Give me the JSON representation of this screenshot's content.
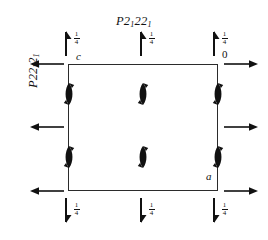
{
  "diagram": {
    "type": "space-group-symmetry-diagram",
    "title": {
      "letter": "P",
      "symbol_parts": [
        "2",
        "1",
        "2",
        "2",
        "1"
      ],
      "text": "P2122₁"
    },
    "side_title": {
      "text": "P22₁2₁"
    },
    "axis_labels": {
      "c": "c",
      "a": "a",
      "origin": "0"
    },
    "fraction_label": {
      "numerator": "1",
      "denominator": "4"
    },
    "top_markers": [
      {
        "name": "top-left-half-arrow",
        "fraction_num": "1",
        "fraction_den": "4",
        "direction": "up"
      },
      {
        "name": "top-center-half-arrow",
        "fraction_num": "1",
        "fraction_den": "4",
        "direction": "up"
      },
      {
        "name": "top-right-half-arrow",
        "fraction_num": "1",
        "fraction_den": "4",
        "direction": "up"
      }
    ],
    "bottom_markers": [
      {
        "name": "bottom-left-half-arrow",
        "fraction_num": "1",
        "fraction_den": "4",
        "direction": "down"
      },
      {
        "name": "bottom-center-half-arrow",
        "fraction_num": "1",
        "fraction_den": "4",
        "direction": "down"
      },
      {
        "name": "bottom-right-half-arrow",
        "fraction_num": "1",
        "fraction_den": "4",
        "direction": "down"
      }
    ],
    "left_arrows": [
      "top-left-arrow",
      "middle-left-arrow",
      "bottom-left-arrow"
    ],
    "right_arrows": [
      "top-right-arrow",
      "middle-right-arrow",
      "bottom-right-arrow"
    ],
    "screw_axes": [
      {
        "name": "screw-axis-left-upper",
        "on_edge": true
      },
      {
        "name": "screw-axis-center-upper",
        "on_edge": false
      },
      {
        "name": "screw-axis-right-upper",
        "on_edge": true
      },
      {
        "name": "screw-axis-left-lower",
        "on_edge": true
      },
      {
        "name": "screw-axis-center-lower",
        "on_edge": false
      },
      {
        "name": "screw-axis-right-lower",
        "on_edge": true
      }
    ],
    "colors": {
      "ink": "#111111",
      "frame": "#2b2b2b",
      "background": "#ffffff"
    }
  }
}
